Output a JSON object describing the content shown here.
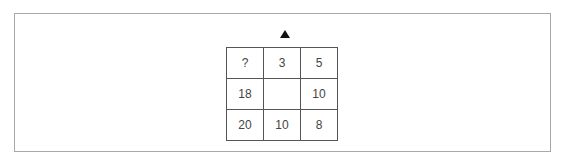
{
  "puzzle": {
    "marker_icon": "triangle-up-icon",
    "grid": [
      [
        "?",
        "3",
        "5"
      ],
      [
        "18",
        "",
        "10"
      ],
      [
        "20",
        "10",
        "8"
      ]
    ]
  }
}
